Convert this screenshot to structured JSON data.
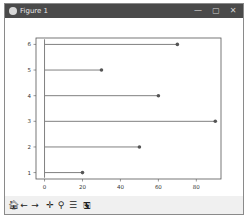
{
  "window": {
    "title": "Figure 1",
    "controls": {
      "minimize": "—",
      "maximize": "▢",
      "close": "✕"
    }
  },
  "toolbar": {
    "buttons": [
      {
        "name": "home",
        "glyph": "🏠︎"
      },
      {
        "name": "back",
        "glyph": "←"
      },
      {
        "name": "forward",
        "glyph": "→"
      },
      {
        "name": "pan",
        "glyph": "✛"
      },
      {
        "name": "zoom",
        "glyph": "⚲"
      },
      {
        "name": "configure-subplots",
        "glyph": "☰"
      },
      {
        "name": "save",
        "glyph": "🖫"
      }
    ]
  },
  "chart_data": {
    "type": "lollipop-horizontal",
    "title": "",
    "xlabel": "",
    "ylabel": "",
    "categories": [
      1,
      2,
      3,
      4,
      5,
      6
    ],
    "values": [
      20,
      50,
      90,
      60,
      30,
      70
    ],
    "x_ticks": [
      0,
      20,
      40,
      60,
      80
    ],
    "y_ticks": [
      1,
      2,
      3,
      4,
      5,
      6
    ],
    "xlim": [
      -4.5,
      93
    ],
    "ylim": [
      0.75,
      6.25
    ],
    "grid": false,
    "legend": null,
    "line_color": "#808080",
    "marker_color": "#555555"
  }
}
